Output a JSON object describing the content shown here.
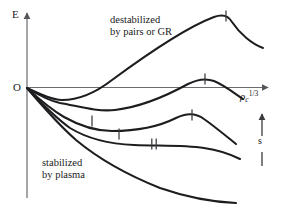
{
  "figure": {
    "title": "",
    "axes": {
      "y_axis_label": "E",
      "origin_label": "O",
      "x_axis_label_base": "ρ",
      "x_axis_label_sub": "c",
      "x_axis_label_sup": "1/3"
    },
    "annotations": {
      "upper_region_line1": "destabilized",
      "upper_region_line2": "by pairs or GR",
      "lower_region_line1": "stabilized",
      "lower_region_line2": "by plasma",
      "entropy_arrow_label": "s"
    },
    "colors": {
      "ink": "#1a1a1a",
      "axis": "#55555a",
      "background": "#ffffff"
    }
  },
  "chart_data": {
    "type": "line",
    "title": "",
    "xlabel": "ρ_c^(1/3)",
    "ylabel": "E",
    "xlim": [
      0,
      1
    ],
    "ylim": [
      -1,
      1
    ],
    "grid": false,
    "legend": "none",
    "notes": [
      "Schematic binding-energy curves versus central density for neutron-star sequences of increasing entropy s.",
      "Curves all start at the origin O; higher curves turn upward (destabilized by pairs or GR), lower curves remain negative (stabilized by plasma).",
      "Tick marks on each curve denote the marginally stable (turning) point; the double tick marks the flattest sequence."
    ],
    "series": [
      {
        "name": "curve-1-destabilized",
        "comment": "rises through zero and peaks above the axis, then falls",
        "path": "M27,88 C40,94 52,100 62,100 C78,100 94,94 112,80 C150,52 190,26 214,17 C222,14 228,15 232,22 C240,34 252,44 263,48",
        "ticks": [
          {
            "x": 226,
            "y": 16,
            "type": "single"
          }
        ]
      },
      {
        "name": "curve-2",
        "comment": "dips, then rises to a low maximum just above the axis before descending",
        "path": "M27,88 C40,96 50,101 60,103 C78,106 96,112 115,110 C140,107 168,95 188,84 C196,80 206,78 214,81 C224,85 234,93 243,99",
        "ticks": [
          {
            "x": 205,
            "y": 79,
            "type": "single"
          }
        ]
      },
      {
        "name": "curve-3",
        "comment": "deeper minimum, shallow maximum below the axis",
        "path": "M27,88 C40,100 52,110 64,117 C80,126 96,131 112,131 C136,131 160,126 176,118 C186,113 196,113 204,119 C214,126 226,136 236,144",
        "ticks": [
          {
            "x": 92,
            "y": 121,
            "type": "single"
          },
          {
            "x": 192,
            "y": 115,
            "type": "single"
          }
        ]
      },
      {
        "name": "curve-4",
        "comment": "flattest sequence, marked with a double tick",
        "path": "M27,88 C42,104 56,118 70,128 C88,139 110,144 134,145 C160,146 184,145 204,148 C218,150 230,154 240,159",
        "ticks": [
          {
            "x": 119,
            "y": 134,
            "type": "single"
          },
          {
            "x": 154,
            "y": 144,
            "type": "double"
          }
        ]
      },
      {
        "name": "curve-5-stabilized",
        "comment": "monotonically decreasing, fully stabilized by plasma",
        "path": "M27,88 C44,108 60,126 76,140 C100,160 130,176 160,188 C186,197 212,202 236,203",
        "ticks": []
      }
    ]
  }
}
